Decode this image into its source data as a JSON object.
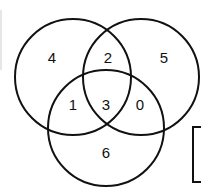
{
  "diagram": {
    "type": "venn",
    "sets": 3,
    "regions": {
      "a_only": "4",
      "ab": "2",
      "b_only": "5",
      "ac": "1",
      "abc": "3",
      "bc": "0",
      "c_only": "6"
    }
  }
}
